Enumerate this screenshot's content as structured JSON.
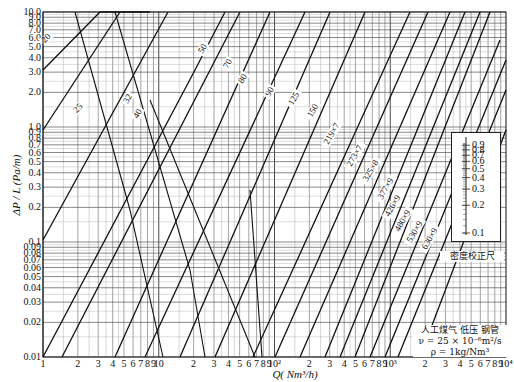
{
  "chart_data": {
    "type": "line",
    "title": "人工煤气 低压 钢管",
    "subtitle_lines": [
      "人工煤气 低压 钢管",
      "ν = 25 × 10⁻⁶ m²/s",
      "ρ = 1kg/Nm³"
    ],
    "xlabel": "Q( Nm³/h)",
    "ylabel": "ΔP / L (Pa/m)",
    "xscale": "log",
    "yscale": "log",
    "xlim": [
      1,
      10000
    ],
    "ylim": [
      0.01,
      10.0
    ],
    "grid": true,
    "x_tick_labels": [
      "1",
      "2",
      "3",
      "4",
      "5",
      "6",
      "7",
      "8",
      "9",
      "10",
      "2",
      "3",
      "4",
      "5",
      "6",
      "7",
      "8",
      "9",
      "10²",
      "2",
      "3",
      "4",
      "5",
      "6",
      "7",
      "8",
      "9",
      "10³",
      "2",
      "3",
      "4",
      "5",
      "6",
      "7",
      "8",
      "9",
      "10⁴"
    ],
    "y_tick_labels": [
      "10.0",
      "9.0",
      "8.0",
      "7.0",
      "6.0",
      "5.0",
      "4.0",
      "3.0",
      "2.0",
      "1.0",
      "0.9",
      "0.8",
      "0.7",
      "0.6",
      "0.5",
      "0.4",
      "0.3",
      "0.2",
      "0.1",
      "0.09",
      "0.08",
      "0.07",
      "0.06",
      "0.05",
      "0.04",
      "0.03",
      "0.02",
      "0.01"
    ],
    "series": [
      {
        "name": "15",
        "px": [
          [
            43,
            130
          ],
          [
            120,
            12
          ]
        ]
      },
      {
        "name": "20",
        "px": [
          [
            43,
            70
          ],
          [
            100,
            12
          ],
          [
            150,
            12
          ]
        ]
      },
      {
        "name": "25",
        "px": [
          [
            43,
            240
          ],
          [
            168,
            12
          ]
        ]
      },
      {
        "name": "32",
        "px": [
          [
            43,
            357
          ],
          [
            195,
            70
          ],
          [
            225,
            12
          ]
        ]
      },
      {
        "name": "40",
        "px": [
          [
            62,
            357
          ],
          [
            240,
            12
          ]
        ]
      },
      {
        "name": "50",
        "px": [
          [
            115,
            357
          ],
          [
            270,
            12
          ]
        ]
      },
      {
        "name": "70",
        "px": [
          [
            145,
            357
          ],
          [
            305,
            12
          ]
        ]
      },
      {
        "name": "80",
        "px": [
          [
            180,
            357
          ],
          [
            330,
            12
          ]
        ]
      },
      {
        "name": "90",
        "px": [
          [
            215,
            357
          ],
          [
            365,
            12
          ]
        ]
      },
      {
        "name": "125",
        "px": [
          [
            253,
            357
          ],
          [
            410,
            12
          ]
        ]
      },
      {
        "name": "150",
        "px": [
          [
            275,
            357
          ],
          [
            428,
            12
          ]
        ]
      },
      {
        "name": "219×7",
        "px": [
          [
            300,
            357
          ],
          [
            450,
            12
          ]
        ]
      },
      {
        "name": "273×7",
        "px": [
          [
            325,
            357
          ],
          [
            465,
            12
          ]
        ]
      },
      {
        "name": "325×8",
        "px": [
          [
            340,
            357
          ],
          [
            480,
            12
          ]
        ]
      },
      {
        "name": "377×9",
        "px": [
          [
            355,
            357
          ],
          [
            490,
            12
          ]
        ]
      },
      {
        "name": "426×9",
        "px": [
          [
            370,
            357
          ],
          [
            500,
            40
          ]
        ]
      },
      {
        "name": "480×9",
        "px": [
          [
            385,
            357
          ],
          [
            506,
            60
          ]
        ]
      },
      {
        "name": "530×9",
        "px": [
          [
            398,
            357
          ],
          [
            506,
            90
          ]
        ]
      },
      {
        "name": "630×9",
        "px": [
          [
            420,
            357
          ],
          [
            506,
            130
          ]
        ]
      }
    ],
    "velocity_lines_px": [
      [
        [
          75,
          12
        ],
        [
          130,
          210
        ],
        [
          163,
          357
        ]
      ],
      [
        [
          115,
          12
        ],
        [
          190,
          270
        ],
        [
          205,
          357
        ]
      ],
      [
        [
          150,
          100
        ],
        [
          255,
          357
        ]
      ],
      [
        [
          250,
          190
        ],
        [
          262,
          357
        ]
      ]
    ],
    "density_correction_scale": {
      "title": "密度校正尺",
      "ticks": [
        "0.9",
        "0.8",
        "0.7",
        "0.6",
        "0.5",
        "0.4",
        "0.3",
        "0.2",
        "0.1"
      ]
    }
  },
  "labels": {
    "ylabel": "ΔP / L (Pa/m)",
    "xlabel": "Q( Nm³/h)",
    "note_line1": "人工煤气 低压 钢管",
    "note_line2": "ν = 25 × 10⁻⁶m²/s",
    "note_line3": "ρ = 1kg/Nm³",
    "scale_title": "密度校正尺"
  },
  "pipe_labels": [
    {
      "text": "20",
      "x": 48,
      "y": 40,
      "rot": -45
    },
    {
      "text": "25",
      "x": 80,
      "y": 110,
      "rot": -45
    },
    {
      "text": "32",
      "x": 130,
      "y": 100,
      "rot": -60
    },
    {
      "text": "40",
      "x": 140,
      "y": 115,
      "rot": -60
    },
    {
      "text": "50",
      "x": 205,
      "y": 50,
      "rot": -60
    },
    {
      "text": "70",
      "x": 230,
      "y": 65,
      "rot": -60
    },
    {
      "text": "80",
      "x": 245,
      "y": 80,
      "rot": -60
    },
    {
      "text": "90",
      "x": 272,
      "y": 93,
      "rot": -60
    },
    {
      "text": "125",
      "x": 296,
      "y": 100,
      "rot": -60
    },
    {
      "text": "150",
      "x": 315,
      "y": 112,
      "rot": -60
    },
    {
      "text": "219×7",
      "x": 334,
      "y": 135,
      "rot": -60
    },
    {
      "text": "273×7",
      "x": 357,
      "y": 157,
      "rot": -60
    },
    {
      "text": "325×8",
      "x": 373,
      "y": 172,
      "rot": -60
    },
    {
      "text": "377×9",
      "x": 388,
      "y": 190,
      "rot": -60
    },
    {
      "text": "426×9",
      "x": 395,
      "y": 207,
      "rot": -60
    },
    {
      "text": "480×9",
      "x": 405,
      "y": 222,
      "rot": -60
    },
    {
      "text": "530×9",
      "x": 417,
      "y": 233,
      "rot": -60
    },
    {
      "text": "630×9",
      "x": 432,
      "y": 240,
      "rot": -60
    }
  ]
}
